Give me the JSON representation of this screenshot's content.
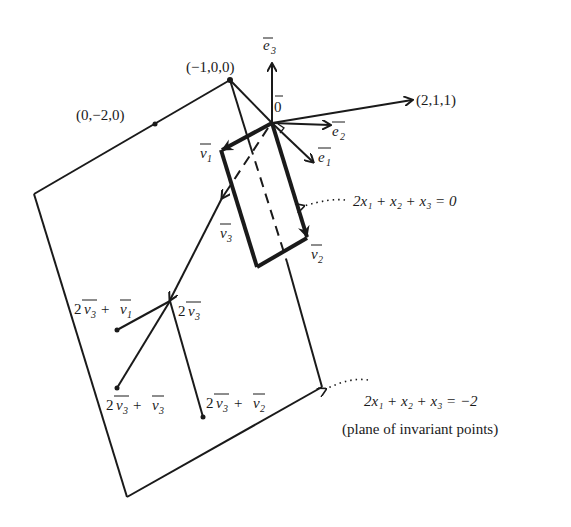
{
  "diagram": {
    "points": {
      "neg_e1": "(−1,0,0)",
      "neg2_e2": "(0,−2,0)",
      "origin": "0",
      "direction": "(2,1,1)"
    },
    "vectors": {
      "e1": "e",
      "e1_sub": "1",
      "e2": "e",
      "e2_sub": "2",
      "e3": "e",
      "e3_sub": "3",
      "v1": "v",
      "v1_sub": "1",
      "v2": "v",
      "v2_sub": "2",
      "v3": "v",
      "v3_sub": "3"
    },
    "combos": {
      "two_v3": "2",
      "plus": "+",
      "two_v3_plus_v1": "2v3 + v1",
      "two_v3_plus_v2": "2v3 + v2",
      "two_v3_plus_v3": "2v3 + v3"
    },
    "planes": {
      "through_origin": "2x₁ + x₂ + x₃ = 0",
      "invariant": "2x₁ + x₂ + x₃ = −2",
      "invariant_note": "(plane of invariant points)"
    }
  }
}
